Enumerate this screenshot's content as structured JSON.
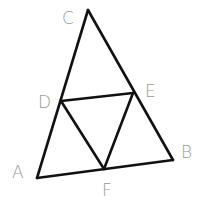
{
  "diagram": {
    "type": "geometry-triangle-midpoints",
    "colors": {
      "line": "#111111",
      "label": "#9a9a9a",
      "background": "#ffffff"
    },
    "points": {
      "A": {
        "x": 37,
        "y": 178
      },
      "B": {
        "x": 173,
        "y": 160
      },
      "C": {
        "x": 88,
        "y": 10
      },
      "D": {
        "x": 61,
        "y": 101
      },
      "E": {
        "x": 133,
        "y": 93
      },
      "F": {
        "x": 104,
        "y": 169
      }
    },
    "segments": [
      [
        "A",
        "B"
      ],
      [
        "B",
        "C"
      ],
      [
        "C",
        "A"
      ],
      [
        "D",
        "E"
      ],
      [
        "E",
        "F"
      ],
      [
        "F",
        "D"
      ]
    ],
    "labels": {
      "A": {
        "text": "A",
        "x": 12,
        "y": 178
      },
      "B": {
        "text": "B",
        "x": 181,
        "y": 158
      },
      "C": {
        "text": "C",
        "x": 62,
        "y": 24
      },
      "D": {
        "text": "D",
        "x": 38,
        "y": 108
      },
      "E": {
        "text": "E",
        "x": 145,
        "y": 97
      },
      "F": {
        "text": "F",
        "x": 102,
        "y": 196
      }
    }
  }
}
